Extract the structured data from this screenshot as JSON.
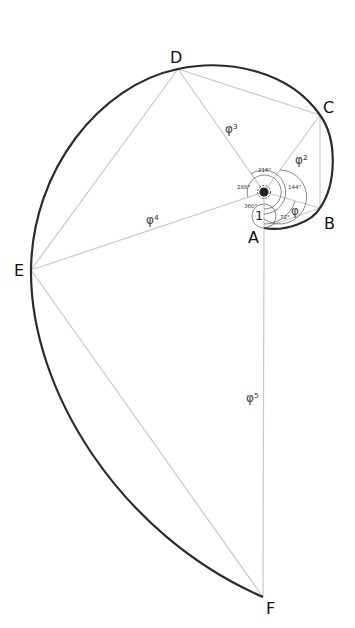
{
  "diagram": {
    "colors": {
      "background": "#ffffff",
      "spiral": "#2b2b2b",
      "guides": "#c8c8c8",
      "text": "#111111"
    },
    "points": {
      "A": "A",
      "B": "B",
      "C": "C",
      "D": "D",
      "E": "E",
      "F": "F"
    },
    "segment_labels": {
      "unit": "1",
      "phi1": "φ",
      "phi2": "φ²",
      "phi3": "φ³",
      "phi4": "φ⁴",
      "phi5": "φ⁵"
    },
    "angle_labels": {
      "a72": "72°",
      "a144": "144°",
      "a216": "216°",
      "a288": "288°",
      "a360": "360°"
    }
  }
}
